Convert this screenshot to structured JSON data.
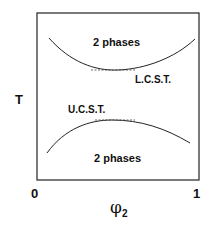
{
  "diagram": {
    "type": "phase-diagram",
    "y_axis_label": "T",
    "x_axis_label": "φ",
    "x_axis_subscript": "2",
    "x_ticks": [
      "0",
      "1"
    ],
    "upper_region_label": "2 phases",
    "lower_region_label": "2 phases",
    "upper_critical_label": "L.C.S.T.",
    "lower_critical_label": "U.C.S.T.",
    "curves": [
      {
        "name": "LCST binodal",
        "shape": "convex-down",
        "min_at_x": 0.5
      },
      {
        "name": "UCST binodal",
        "shape": "concave-down",
        "max_at_x": 0.45
      }
    ],
    "colors": {
      "line": "#222222",
      "text": "#111111",
      "background": "#ffffff"
    }
  }
}
